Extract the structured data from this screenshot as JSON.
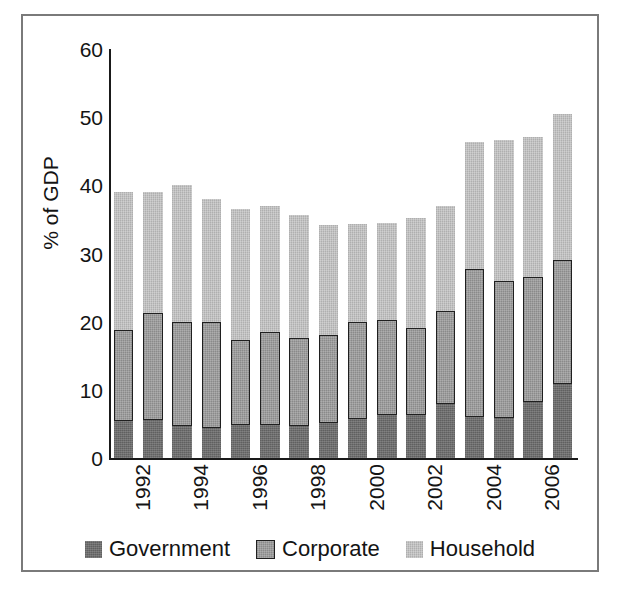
{
  "chart_data": {
    "type": "bar",
    "subtype": "stacked-vertical",
    "title": "",
    "xlabel": "",
    "ylabel": "% of GDP",
    "ylim": [
      0,
      60
    ],
    "yticks": [
      0,
      10,
      20,
      30,
      40,
      50,
      60
    ],
    "ytick_labels": [
      "0",
      "10",
      "20",
      "30",
      "40",
      "50",
      "60"
    ],
    "grid": false,
    "legend_position": "bottom-center",
    "categories": [
      "1992",
      "1993",
      "1994",
      "1995",
      "1996",
      "1997",
      "1998",
      "1999",
      "2000",
      "2001",
      "2002",
      "2003",
      "2004",
      "2005",
      "2006",
      "2007"
    ],
    "xtick_labels_shown": [
      "1992",
      "1994",
      "1996",
      "1998",
      "2000",
      "2002",
      "2004",
      "2006"
    ],
    "series": [
      {
        "name": "Government",
        "color": "#6e6e6e",
        "values": [
          5.5,
          5.6,
          4.7,
          4.4,
          4.8,
          4.8,
          4.7,
          5.1,
          5.7,
          6.3,
          6.3,
          7.9,
          6.0,
          5.9,
          8.2,
          10.8
        ]
      },
      {
        "name": "Corporate",
        "color": "#9d9d9d",
        "values": [
          13.3,
          15.7,
          15.3,
          15.6,
          12.5,
          13.7,
          12.9,
          12.9,
          14.2,
          14.0,
          12.8,
          13.6,
          21.8,
          20.0,
          18.3,
          18.2
        ]
      },
      {
        "name": "Household",
        "color": "#c3c3c3",
        "values": [
          20.2,
          17.7,
          20.0,
          18.0,
          19.2,
          18.5,
          18.0,
          16.2,
          14.5,
          14.2,
          16.1,
          15.5,
          18.5,
          20.7,
          20.6,
          21.5
        ]
      }
    ],
    "totals": [
      39.0,
      39.0,
      40.0,
      38.0,
      36.5,
      37.0,
      35.6,
      34.2,
      34.4,
      34.5,
      35.2,
      37.0,
      46.3,
      46.6,
      47.1,
      50.5
    ]
  },
  "legend": {
    "items": [
      {
        "label": "Government",
        "color": "#6e6e6e"
      },
      {
        "label": "Corporate",
        "color": "#9d9d9d"
      },
      {
        "label": "Household",
        "color": "#c3c3c3"
      }
    ]
  },
  "colors": {
    "frame_border": "#7a7a7a",
    "axis": "#1a1a1a",
    "text": "#141414",
    "background": "#ffffff"
  }
}
